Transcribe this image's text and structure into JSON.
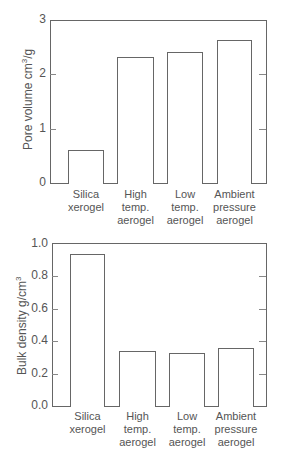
{
  "chart_data": [
    {
      "type": "bar",
      "title": "",
      "xlabel": "",
      "ylabel": "Pore volume cm3/g",
      "ylabel_main": "Pore volume cm",
      "ylabel_sup": "3",
      "ylabel_tail": "/g",
      "ylim": [
        0,
        3
      ],
      "yticks": [
        "0",
        "1",
        "2",
        "3"
      ],
      "categories": [
        "Silica xerogel",
        "High temp. aerogel",
        "Low temp. aerogel",
        "Ambient pressure aerogel"
      ],
      "category_lines": [
        [
          "Silica",
          "xerogel"
        ],
        [
          "High",
          "temp.",
          "aerogel"
        ],
        [
          "Low",
          "temp.",
          "aerogel"
        ],
        [
          "Ambient",
          "pressure",
          "aerogel"
        ]
      ],
      "values": [
        0.61,
        2.32,
        2.41,
        2.64
      ],
      "grid": false,
      "legend": null
    },
    {
      "type": "bar",
      "title": "",
      "xlabel": "",
      "ylabel": "Bulk density g/cm3",
      "ylabel_main": "Bulk density g/cm",
      "ylabel_sup": "3",
      "ylabel_tail": "",
      "ylim": [
        0,
        1.0
      ],
      "yticks": [
        "0.0",
        "0.2",
        "0.4",
        "0.6",
        "0.8",
        "1.0"
      ],
      "categories": [
        "Silica xerogel",
        "High temp. aerogel",
        "Low temp. aerogel",
        "Ambient pressure aerogel"
      ],
      "category_lines": [
        [
          "Silica",
          "xerogel"
        ],
        [
          "High",
          "temp.",
          "aerogel"
        ],
        [
          "Low",
          "temp.",
          "aerogel"
        ],
        [
          "Ambient",
          "pressure",
          "aerogel"
        ]
      ],
      "values": [
        0.94,
        0.34,
        0.33,
        0.36
      ],
      "grid": false,
      "legend": null
    }
  ]
}
